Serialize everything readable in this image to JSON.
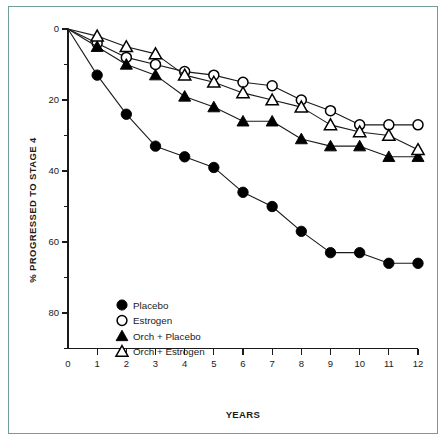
{
  "chart_data": {
    "type": "line",
    "title": "",
    "xlabel": "YEARS",
    "ylabel": "% PROGRESSED TO STAGE 4",
    "x": [
      0,
      1,
      2,
      3,
      4,
      5,
      6,
      7,
      8,
      9,
      10,
      11,
      12
    ],
    "xlim": [
      0,
      12
    ],
    "ylim": [
      0,
      90
    ],
    "y_inverted": true,
    "xticks": [
      "0",
      "1",
      "2",
      "3",
      "4",
      "5",
      "6",
      "7",
      "8",
      "9",
      "10",
      "11",
      "12"
    ],
    "yticks": [
      "0",
      "20",
      "40",
      "60",
      "80"
    ],
    "ytick_values": [
      0,
      20,
      40,
      60,
      80
    ],
    "yminor_values": [
      10,
      30,
      50,
      70,
      90
    ],
    "grid": false,
    "legend_position": "lower-left-inside",
    "series": [
      {
        "name": "Placebo",
        "marker": "filled-circle",
        "values": [
          0,
          13,
          24,
          33,
          36,
          39,
          46,
          50,
          57,
          63,
          63,
          66,
          66
        ]
      },
      {
        "name": "Estrogen",
        "marker": "open-circle",
        "values": [
          0,
          4,
          8,
          10,
          12,
          13,
          15,
          16,
          20,
          23,
          27,
          27,
          27
        ]
      },
      {
        "name": "Orch + Placebo",
        "marker": "filled-triangle",
        "values": [
          0,
          5,
          10,
          13,
          19,
          22,
          26,
          26,
          31,
          33,
          33,
          36,
          36
        ]
      },
      {
        "name": "Orch + Estrogen",
        "marker": "open-triangle",
        "values": [
          0,
          2,
          5,
          7,
          13,
          15,
          18,
          20,
          22,
          27,
          29,
          30,
          34
        ]
      }
    ]
  },
  "colors": {
    "ink": "#1a1a1a",
    "marker_fill": "#000000",
    "marker_open": "#ffffff",
    "frame_border": "#6f9e99",
    "background": "#ffffff"
  },
  "legend": {
    "items": [
      {
        "label": "Placebo",
        "marker": "filled-circle"
      },
      {
        "label": "Estrogen",
        "marker": "open-circle"
      },
      {
        "label": "Orch + Placebo",
        "marker": "filled-triangle"
      },
      {
        "label": "Orch + Estrogen",
        "marker": "open-triangle"
      }
    ]
  }
}
